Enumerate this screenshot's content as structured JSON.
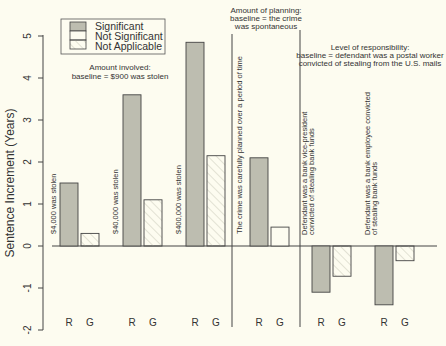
{
  "chart_data": {
    "type": "bar",
    "title": "",
    "ylabel": "Sentence Increment (Years)",
    "xlabel": "",
    "ylim": [
      -2,
      5
    ],
    "yticks": [
      "-2",
      "-1",
      "0",
      "1",
      "2",
      "3",
      "4",
      "5"
    ],
    "legend": {
      "position": "top-left",
      "entries": [
        {
          "label": "Significant",
          "fill": "#bdbdb0",
          "pattern": "solid"
        },
        {
          "label": "Not Significant",
          "fill": "#fdfcf0",
          "pattern": "none"
        },
        {
          "label": "Not Applicable",
          "fill": "#fdfcf0",
          "pattern": "hatch"
        }
      ]
    },
    "groups": [
      {
        "section": "Amount involved",
        "section_note": "baseline = $900 was stolen",
        "label": "$4,000 was stolen",
        "bars": [
          {
            "name": "R",
            "value": 1.5,
            "status": "Significant"
          },
          {
            "name": "G",
            "value": 0.3,
            "status": "Not Applicable"
          }
        ]
      },
      {
        "section": "Amount involved",
        "label": "$40,000 was stolen",
        "bars": [
          {
            "name": "R",
            "value": 3.6,
            "status": "Significant"
          },
          {
            "name": "G",
            "value": 1.1,
            "status": "Not Applicable"
          }
        ]
      },
      {
        "section": "Amount involved",
        "label": "$400,000 was stolen",
        "bars": [
          {
            "name": "R",
            "value": 4.85,
            "status": "Significant"
          },
          {
            "name": "G",
            "value": 2.15,
            "status": "Not Applicable"
          }
        ]
      },
      {
        "section": "Amount of planning",
        "section_note": "baseline = the crime was spontaneous",
        "label": "The crime was carefully planned over a period of time",
        "bars": [
          {
            "name": "R",
            "value": 2.1,
            "status": "Significant"
          },
          {
            "name": "G",
            "value": 0.45,
            "status": "Not Significant"
          }
        ]
      },
      {
        "section": "Level of responsibility",
        "section_note": "baseline = defendant was a postal worker convicted of stealing from the U.S. mails",
        "label": "Defendant was a bank vice-president convicted of stealing bank funds",
        "bars": [
          {
            "name": "R",
            "value": -1.1,
            "status": "Significant"
          },
          {
            "name": "G",
            "value": -0.72,
            "status": "Not Applicable"
          }
        ]
      },
      {
        "section": "Level of responsibility",
        "label": "Defendant was a bank employee convicted of stealing bank funds",
        "bars": [
          {
            "name": "R",
            "value": -1.4,
            "status": "Significant"
          },
          {
            "name": "G",
            "value": -0.35,
            "status": "Not Applicable"
          }
        ]
      }
    ]
  },
  "labels": {
    "ylabel": "Sentence Increment (Years)",
    "legend": [
      "Significant",
      "Not Significant",
      "Not Applicable"
    ],
    "sec1": [
      "Amount involved:",
      "baseline = $900 was stolen"
    ],
    "sec2": [
      "Amount of planning:",
      "baseline = the crime",
      "was spontaneous"
    ],
    "sec3": [
      "Level of responsibility:",
      "baseline = defendant was a postal worker",
      "convicted of stealing from the U.S. mails"
    ],
    "g1": "$4,000 was stolen",
    "g2": "$40,000 was stolen",
    "g3": "$400,000 was stolen",
    "g4": "The crime was carefully planned over a period of time",
    "g5": [
      "Defendant was a bank vice-president",
      "convicted of stealing bank funds"
    ],
    "g6": [
      "Defendant was a bank employee convicted",
      "of stealing bank funds"
    ],
    "r": "R",
    "g": "G"
  }
}
